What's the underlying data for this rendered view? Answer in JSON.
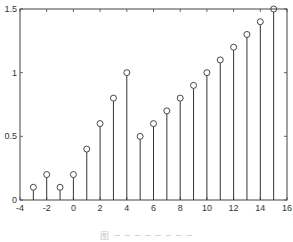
{
  "chart_data": {
    "type": "stem",
    "title": "",
    "xlabel": "",
    "ylabel": "",
    "x": [
      -3,
      -2,
      -1,
      0,
      1,
      2,
      3,
      4,
      5,
      6,
      7,
      8,
      9,
      10,
      11,
      12,
      13,
      14,
      15
    ],
    "values": [
      0.1,
      0.2,
      0.1,
      0.2,
      0.4,
      0.6,
      0.8,
      1.0,
      0.5,
      0.6,
      0.7,
      0.8,
      0.9,
      1.0,
      1.1,
      1.2,
      1.3,
      1.4,
      1.5
    ],
    "xlim": [
      -4,
      16
    ],
    "ylim": [
      0,
      1.5
    ],
    "xticks": [
      -4,
      -2,
      0,
      2,
      4,
      6,
      8,
      10,
      12,
      14,
      16
    ],
    "yticks": [
      0,
      0.5,
      1,
      1.5
    ],
    "xtick_labels": [
      "-4",
      "-2",
      "0",
      "2",
      "4",
      "6",
      "8",
      "10",
      "12",
      "14",
      "16"
    ],
    "ytick_labels": [
      "0",
      "0.5",
      "1",
      "1.5"
    ],
    "grid": false,
    "legend": null,
    "marker": "circle-open",
    "color": "#333333"
  },
  "caption": "图 ─ ─ ─ ─ ─ ─ ─ ─"
}
